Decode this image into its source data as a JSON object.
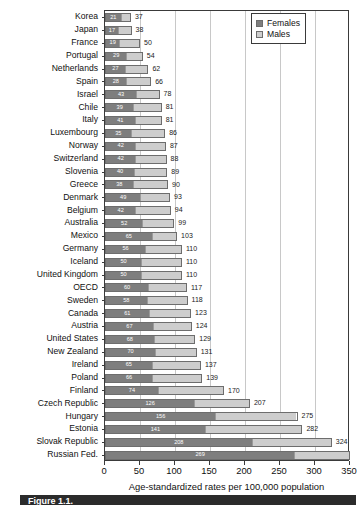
{
  "chart": {
    "type": "bar",
    "orientation": "horizontal",
    "stacked": true,
    "xlabel": "Age-standardized rates per 100,000 population",
    "ylabel": "",
    "title": "",
    "xlim": [
      0,
      350
    ],
    "xticks": [
      "0",
      "50",
      "100",
      "150",
      "200",
      "250",
      "300",
      "350"
    ],
    "grid": true,
    "legend_position": "top-right"
  },
  "legend": {
    "items": [
      {
        "label": "Females",
        "color": "#7e7e7e",
        "key": "females"
      },
      {
        "label": "Males",
        "color": "#cdcdcd",
        "key": "males"
      }
    ]
  },
  "caption": {
    "text": "Figure 1.1."
  },
  "chart_data": {
    "type": "bar",
    "title": "",
    "xlabel": "Age-standardized rates per 100,000 population",
    "ylabel": "",
    "xlim": [
      0,
      350
    ],
    "grid": true,
    "legend_position": "top-right",
    "stacked": true,
    "orientation": "horizontal",
    "categories": [
      "Korea",
      "Japan",
      "France",
      "Portugal",
      "Netherlands",
      "Spain",
      "Israel",
      "Chile",
      "Italy",
      "Luxembourg",
      "Norway",
      "Switzerland",
      "Slovenia",
      "Greece",
      "Denmark",
      "Belgium",
      "Australia",
      "Mexico",
      "Germany",
      "Iceland",
      "United Kingdom",
      "OECD",
      "Sweden",
      "Canada",
      "Austria",
      "United States",
      "New Zealand",
      "Ireland",
      "Poland",
      "Finland",
      "Czech Republic",
      "Hungary",
      "Estonia",
      "Slovak Republic",
      "Russian Fed."
    ],
    "series": [
      {
        "name": "Females",
        "color": "#7e7e7e",
        "values": [
          21,
          17,
          19,
          29,
          27,
          28,
          43,
          39,
          41,
          35,
          42,
          42,
          40,
          38,
          49,
          42,
          52,
          65,
          56,
          50,
          50,
          60,
          58,
          61,
          67,
          68,
          70,
          65,
          66,
          74,
          126,
          156,
          141,
          208,
          269
        ]
      },
      {
        "name": "Males",
        "color": "#cdcdcd",
        "values": [
          37,
          38,
          50,
          54,
          62,
          66,
          78,
          81,
          81,
          86,
          87,
          88,
          89,
          90,
          93,
          94,
          99,
          103,
          110,
          110,
          110,
          117,
          118,
          123,
          124,
          129,
          131,
          137,
          139,
          170,
          207,
          275,
          282,
          324,
          350
        ]
      }
    ]
  },
  "rows": [
    {
      "category": "Korea",
      "females": 21,
      "total": 37,
      "total_label": "37"
    },
    {
      "category": "Japan",
      "females": 17,
      "total": 38,
      "total_label": "38"
    },
    {
      "category": "France",
      "females": 19,
      "total": 50,
      "total_label": "50"
    },
    {
      "category": "Portugal",
      "females": 29,
      "total": 54,
      "total_label": "54"
    },
    {
      "category": "Netherlands",
      "females": 27,
      "total": 62,
      "total_label": "62"
    },
    {
      "category": "Spain",
      "females": 28,
      "total": 66,
      "total_label": "66"
    },
    {
      "category": "Israel",
      "females": 43,
      "total": 78,
      "total_label": "78"
    },
    {
      "category": "Chile",
      "females": 39,
      "total": 81,
      "total_label": "81"
    },
    {
      "category": "Italy",
      "females": 41,
      "total": 81,
      "total_label": "81"
    },
    {
      "category": "Luxembourg",
      "females": 35,
      "total": 86,
      "total_label": "86"
    },
    {
      "category": "Norway",
      "females": 42,
      "total": 87,
      "total_label": "87"
    },
    {
      "category": "Switzerland",
      "females": 42,
      "total": 88,
      "total_label": "88"
    },
    {
      "category": "Slovenia",
      "females": 40,
      "total": 89,
      "total_label": "89"
    },
    {
      "category": "Greece",
      "females": 38,
      "total": 90,
      "total_label": "90"
    },
    {
      "category": "Denmark",
      "females": 49,
      "total": 93,
      "total_label": "93"
    },
    {
      "category": "Belgium",
      "females": 42,
      "total": 94,
      "total_label": "94"
    },
    {
      "category": "Australia",
      "females": 52,
      "total": 99,
      "total_label": "99"
    },
    {
      "category": "Mexico",
      "females": 65,
      "total": 103,
      "total_label": "103"
    },
    {
      "category": "Germany",
      "females": 56,
      "total": 110,
      "total_label": "110"
    },
    {
      "category": "Iceland",
      "females": 50,
      "total": 110,
      "total_label": "110"
    },
    {
      "category": "United Kingdom",
      "females": 50,
      "total": 110,
      "total_label": "110"
    },
    {
      "category": "OECD",
      "females": 60,
      "total": 117,
      "total_label": "117"
    },
    {
      "category": "Sweden",
      "females": 58,
      "total": 118,
      "total_label": "118"
    },
    {
      "category": "Canada",
      "females": 61,
      "total": 123,
      "total_label": "123"
    },
    {
      "category": "Austria",
      "females": 67,
      "total": 124,
      "total_label": "124"
    },
    {
      "category": "United States",
      "females": 68,
      "total": 129,
      "total_label": "129"
    },
    {
      "category": "New Zealand",
      "females": 70,
      "total": 131,
      "total_label": "131"
    },
    {
      "category": "Ireland",
      "females": 65,
      "total": 137,
      "total_label": "137"
    },
    {
      "category": "Poland",
      "females": 66,
      "total": 139,
      "total_label": "139"
    },
    {
      "category": "Finland",
      "females": 74,
      "total": 170,
      "total_label": "170"
    },
    {
      "category": "Czech Republic",
      "females": 126,
      "total": 207,
      "total_label": "207"
    },
    {
      "category": "Hungary",
      "females": 156,
      "total": 275,
      "total_label": "275"
    },
    {
      "category": "Estonia",
      "females": 141,
      "total": 282,
      "total_label": "282"
    },
    {
      "category": "Slovak Republic",
      "females": 208,
      "total": 324,
      "total_label": "324"
    },
    {
      "category": "Russian Fed.",
      "females": 269,
      "total": 350,
      "total_label": ""
    }
  ]
}
